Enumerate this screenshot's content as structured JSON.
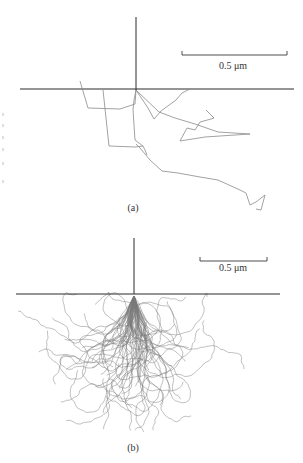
{
  "figure": {
    "panels": [
      {
        "id": "a",
        "label": "(a)",
        "scale_bar_label": "0.5 μm",
        "description": "Single electron trajectory scattering in a solid"
      },
      {
        "id": "b",
        "label": "(b)",
        "scale_bar_label": "0.5 μm",
        "description": "Many electron trajectories forming interaction volume"
      }
    ]
  },
  "geometry": {
    "panel_a": {
      "beam": [
        136,
        17,
        136,
        90
      ],
      "surface": [
        20,
        89,
        294,
        89
      ],
      "scale_bar": {
        "x1": 182,
        "x2": 287,
        "y": 55,
        "tick": 4,
        "label_x": 233,
        "label_y": 69
      },
      "label_pos": [
        133,
        211
      ],
      "trajectory_1": [
        [
          136,
          90
        ],
        [
          134,
          100
        ],
        [
          133,
          110
        ],
        [
          135,
          140
        ],
        [
          143,
          146
        ],
        [
          135,
          147
        ],
        [
          109,
          146
        ],
        [
          103,
          90
        ]
      ],
      "trajectory_2": [
        [
          136,
          90
        ],
        [
          135,
          104
        ],
        [
          120,
          109
        ],
        [
          88,
          108
        ],
        [
          80,
          81
        ]
      ],
      "trajectory_3": [
        [
          136,
          90
        ],
        [
          148,
          108
        ],
        [
          154,
          119
        ],
        [
          161,
          111
        ],
        [
          176,
          100
        ],
        [
          182,
          93
        ],
        [
          190,
          89
        ]
      ],
      "trajectory_4": [
        [
          136,
          90
        ],
        [
          159,
          112
        ],
        [
          175,
          118
        ],
        [
          195,
          124
        ],
        [
          218,
          132
        ],
        [
          250,
          134
        ],
        [
          205,
          137
        ],
        [
          180,
          141
        ],
        [
          187,
          128
        ],
        [
          195,
          130
        ],
        [
          200,
          122
        ],
        [
          211,
          119
        ],
        [
          214,
          118
        ],
        [
          206,
          110
        ]
      ],
      "trajectory_5": [
        [
          136,
          144
        ],
        [
          140,
          148
        ],
        [
          150,
          160
        ],
        [
          162,
          171
        ],
        [
          178,
          173
        ],
        [
          200,
          177
        ],
        [
          218,
          180
        ],
        [
          240,
          190
        ],
        [
          246,
          193
        ],
        [
          250,
          205
        ],
        [
          256,
          202
        ],
        [
          265,
          195
        ],
        [
          261,
          210
        ],
        [
          256,
          209
        ]
      ],
      "trajectory_6": [
        [
          143,
          146
        ],
        [
          145,
          150
        ],
        [
          147,
          155
        ]
      ]
    },
    "panel_b": {
      "beam": [
        134,
        238,
        134,
        294
      ],
      "surface": [
        16,
        294,
        280,
        294
      ],
      "scale_bar": {
        "x1": 200,
        "x2": 267,
        "y": 261,
        "tick": 4,
        "label_x": 233,
        "label_y": 271
      },
      "label_pos": [
        133,
        451
      ],
      "origin": [
        134,
        296
      ],
      "num_trajectories": 70,
      "seed": 20231,
      "extent": {
        "xmin": 14,
        "xmax": 282,
        "ymin": 292,
        "ymax": 432
      }
    },
    "bleed_marks": [
      [
        3,
        113
      ],
      [
        3,
        124
      ],
      [
        3,
        136
      ],
      [
        3,
        148
      ],
      [
        3,
        162
      ],
      [
        3,
        180
      ]
    ]
  },
  "colors": {
    "axis": "#2a2a2a",
    "trajectory": "#8a8a8a",
    "text": "#333333"
  }
}
